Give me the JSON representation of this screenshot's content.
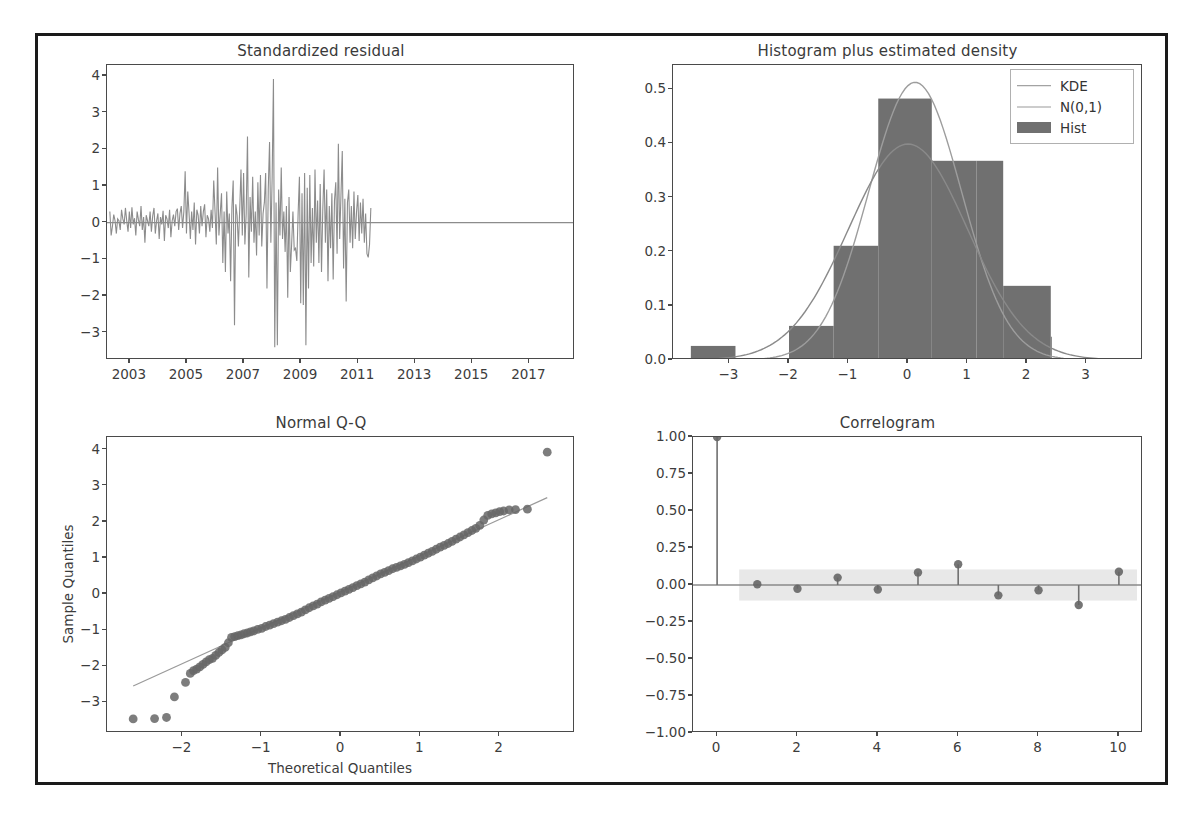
{
  "figure": {
    "background": "#ffffff",
    "frame_color": "#1a1a1a",
    "line_color": "#8c8c8c",
    "marker_color": "#666666",
    "hist_fill": "#707070",
    "ci_band": "#e8e8e8"
  },
  "panels": {
    "residual": {
      "title": "Standardized residual",
      "xticks": [
        "2003",
        "2005",
        "2007",
        "2009",
        "2011",
        "2013",
        "2015",
        "2017"
      ],
      "yticks": [
        "4",
        "3",
        "2",
        "1",
        "0",
        "−1",
        "−2",
        "−3"
      ]
    },
    "histogram": {
      "title": "Histogram plus estimated density",
      "xticks": [
        "−3",
        "−2",
        "−1",
        "0",
        "1",
        "2",
        "3"
      ],
      "yticks": [
        "0.5",
        "0.4",
        "0.3",
        "0.2",
        "0.1",
        "0.0"
      ],
      "legend": [
        {
          "label": "KDE",
          "type": "line"
        },
        {
          "label": "N(0,1)",
          "type": "line"
        },
        {
          "label": "Hist",
          "type": "patch"
        }
      ]
    },
    "qq": {
      "title": "Normal Q-Q",
      "xlabel": "Theoretical Quantiles",
      "ylabel": "Sample Quantiles",
      "xticks": [
        "−2",
        "−1",
        "0",
        "1",
        "2"
      ],
      "yticks": [
        "4",
        "3",
        "2",
        "1",
        "0",
        "−1",
        "−2",
        "−3"
      ]
    },
    "correlogram": {
      "title": "Correlogram",
      "xticks": [
        "0",
        "2",
        "4",
        "6",
        "8",
        "10"
      ],
      "yticks": [
        "1.00",
        "0.75",
        "0.50",
        "0.25",
        "0.00",
        "−0.25",
        "−0.50",
        "−0.75",
        "−1.00"
      ]
    }
  },
  "chart_data": [
    {
      "type": "line",
      "panel": "residual",
      "title": "Standardized residual",
      "xlabel": "",
      "ylabel": "",
      "xlim": [
        2002.2,
        2018.6
      ],
      "ylim": [
        -3.75,
        4.3
      ],
      "grid": false,
      "xtick_values": [
        2003,
        2005,
        2007,
        2009,
        2011,
        2013,
        2015,
        2017
      ],
      "ytick_values": [
        4,
        3,
        2,
        1,
        0,
        -1,
        -2,
        -3
      ],
      "series": [
        {
          "name": "standardized residual",
          "x_start": 2002.3,
          "x_step": 0.0455,
          "values": [
            0.3,
            -0.35,
            -0.1,
            0.22,
            0.05,
            -0.3,
            0.1,
            0.05,
            -0.2,
            0.35,
            0.1,
            -0.05,
            0.4,
            0.05,
            -0.25,
            0.3,
            -0.15,
            0.42,
            -0.05,
            0.12,
            -0.35,
            0.3,
            0.08,
            -0.1,
            0.45,
            -0.2,
            0.15,
            -0.55,
            0.2,
            0.05,
            -0.1,
            0.3,
            -0.25,
            0.18,
            0.4,
            -0.3,
            0.05,
            0.25,
            -0.45,
            0.15,
            -0.05,
            0.32,
            -0.5,
            0.2,
            0.1,
            -0.15,
            0.35,
            -0.4,
            0.05,
            0.22,
            -0.1,
            0.3,
            0.38,
            -0.2,
            0.25,
            0.45,
            -0.15,
            0.3,
            1.4,
            -0.3,
            0.85,
            0.25,
            -0.45,
            0.3,
            -0.2,
            0.55,
            -0.6,
            0.35,
            0.2,
            -0.3,
            0.45,
            -0.1,
            0.3,
            0.5,
            -0.4,
            0.2,
            0.1,
            -0.25,
            0.35,
            -0.15,
            1.15,
            0.3,
            -0.6,
            1.5,
            -0.35,
            0.25,
            0.8,
            -1.1,
            0.3,
            -1.35,
            0.85,
            -0.3,
            0.25,
            -1.6,
            0.4,
            1.15,
            -2.8,
            0.5,
            0.2,
            -0.65,
            0.35,
            1.45,
            -0.35,
            1.35,
            -0.6,
            0.25,
            2.35,
            -1.5,
            0.7,
            -0.25,
            1.25,
            -0.55,
            0.3,
            -0.9,
            1.1,
            -0.35,
            1.3,
            -0.65,
            0.25,
            0.55,
            1.35,
            -1.8,
            0.9,
            2.2,
            -0.55,
            1.25,
            3.92,
            -3.4,
            0.55,
            -3.35,
            0.9,
            -0.35,
            1.5,
            -0.45,
            0.3,
            -0.8,
            0.45,
            -2.05,
            0.7,
            -1.35,
            -0.6,
            0.3,
            -0.75,
            -0.7,
            -1.05,
            0.25,
            1.25,
            -2.2,
            0.8,
            -2.25,
            1.35,
            -3.35,
            0.95,
            -1.8,
            1.3,
            -1.1,
            0.4,
            -1.2,
            1.45,
            -0.55,
            0.6,
            -1.1,
            1.05,
            -1.35,
            0.35,
            1.45,
            -0.55,
            0.9,
            -1.6,
            0.45,
            -0.7,
            0.8,
            -1.55,
            0.6,
            1.1,
            -0.85,
            2.15,
            -0.45,
            0.75,
            1.95,
            -1.25,
            0.65,
            -2.15,
            0.55,
            0.9,
            -0.55,
            0.45,
            -0.7,
            0.85,
            -0.45,
            0.3,
            0.75,
            -0.5,
            0.55,
            -0.3,
            0.65,
            -0.55,
            0.25,
            -0.85,
            -0.95,
            -0.6,
            0.4
          ]
        },
        {
          "name": "zero-line",
          "constant": 0
        }
      ]
    },
    {
      "type": "bar",
      "panel": "histogram",
      "title": "Histogram plus estimated density",
      "xlabel": "",
      "ylabel": "",
      "xlim": [
        -3.95,
        3.95
      ],
      "ylim": [
        0.0,
        0.545
      ],
      "grid": false,
      "xtick_values": [
        -3,
        -2,
        -1,
        0,
        1,
        2,
        3
      ],
      "ytick_values": [
        0.0,
        0.1,
        0.2,
        0.3,
        0.4,
        0.5
      ],
      "bin_edges": [
        -3.65,
        -2.9,
        -2.0,
        -1.25,
        -0.5,
        0.4,
        1.15,
        1.6,
        2.4
      ],
      "bars": [
        {
          "left": -3.65,
          "right": -2.9,
          "height": 0.026
        },
        {
          "left": -2.9,
          "right": -2.0,
          "height": 0.003
        },
        {
          "left": -2.0,
          "right": -1.25,
          "height": 0.063
        },
        {
          "left": -1.25,
          "right": -0.5,
          "height": 0.211
        },
        {
          "left": -0.5,
          "right": 0.4,
          "height": 0.483
        },
        {
          "left": 0.4,
          "right": 1.15,
          "height": 0.368
        },
        {
          "left": 1.15,
          "right": 1.6,
          "height": 0.368
        },
        {
          "left": 1.6,
          "right": 2.4,
          "height": 0.137
        },
        {
          "left": 2.4,
          "right": 2.4,
          "height": 0.043
        }
      ],
      "curves": [
        {
          "name": "KDE",
          "peak_x": 0.12,
          "peak_y": 0.513,
          "sigma": 0.78
        },
        {
          "name": "N(0,1)",
          "peak_x": 0.0,
          "peak_y": 0.399,
          "sigma": 1.0
        }
      ]
    },
    {
      "type": "scatter",
      "panel": "qq",
      "title": "Normal Q-Q",
      "xlabel": "Theoretical Quantiles",
      "ylabel": "Sample Quantiles",
      "xlim": [
        -2.95,
        2.95
      ],
      "ylim": [
        -3.85,
        4.35
      ],
      "grid": false,
      "xtick_values": [
        -2,
        -1,
        0,
        1,
        2
      ],
      "ytick_values": [
        4,
        3,
        2,
        1,
        0,
        -1,
        -2,
        -3
      ],
      "reference_line": {
        "slope": 1.0,
        "intercept": 0.07,
        "x_from": -2.62,
        "x_to": 2.6
      },
      "points": [
        [
          -2.62,
          -3.46
        ],
        [
          -2.35,
          -3.45
        ],
        [
          -2.2,
          -3.42
        ],
        [
          -2.1,
          -2.85
        ],
        [
          -1.96,
          -2.45
        ],
        [
          -1.9,
          -2.2
        ],
        [
          -1.86,
          -2.12
        ],
        [
          -1.82,
          -2.08
        ],
        [
          -1.78,
          -2.02
        ],
        [
          -1.74,
          -1.95
        ],
        [
          -1.7,
          -1.88
        ],
        [
          -1.66,
          -1.82
        ],
        [
          -1.62,
          -1.78
        ],
        [
          -1.58,
          -1.7
        ],
        [
          -1.54,
          -1.62
        ],
        [
          -1.5,
          -1.55
        ],
        [
          -1.46,
          -1.48
        ],
        [
          -1.42,
          -1.35
        ],
        [
          -1.38,
          -1.2
        ],
        [
          -1.34,
          -1.18
        ],
        [
          -1.3,
          -1.15
        ],
        [
          -1.26,
          -1.13
        ],
        [
          -1.22,
          -1.1
        ],
        [
          -1.18,
          -1.08
        ],
        [
          -1.14,
          -1.05
        ],
        [
          -1.1,
          -1.02
        ],
        [
          -1.05,
          -0.98
        ],
        [
          -1.0,
          -0.95
        ],
        [
          -0.95,
          -0.9
        ],
        [
          -0.9,
          -0.86
        ],
        [
          -0.85,
          -0.82
        ],
        [
          -0.8,
          -0.78
        ],
        [
          -0.75,
          -0.74
        ],
        [
          -0.7,
          -0.7
        ],
        [
          -0.65,
          -0.65
        ],
        [
          -0.6,
          -0.6
        ],
        [
          -0.55,
          -0.55
        ],
        [
          -0.5,
          -0.5
        ],
        [
          -0.45,
          -0.44
        ],
        [
          -0.4,
          -0.38
        ],
        [
          -0.35,
          -0.33
        ],
        [
          -0.3,
          -0.28
        ],
        [
          -0.25,
          -0.22
        ],
        [
          -0.2,
          -0.17
        ],
        [
          -0.15,
          -0.12
        ],
        [
          -0.1,
          -0.07
        ],
        [
          -0.05,
          -0.02
        ],
        [
          0.0,
          0.03
        ],
        [
          0.05,
          0.08
        ],
        [
          0.1,
          0.13
        ],
        [
          0.15,
          0.18
        ],
        [
          0.2,
          0.23
        ],
        [
          0.25,
          0.28
        ],
        [
          0.3,
          0.33
        ],
        [
          0.35,
          0.39
        ],
        [
          0.4,
          0.45
        ],
        [
          0.45,
          0.5
        ],
        [
          0.5,
          0.56
        ],
        [
          0.55,
          0.6
        ],
        [
          0.6,
          0.65
        ],
        [
          0.65,
          0.7
        ],
        [
          0.7,
          0.74
        ],
        [
          0.75,
          0.78
        ],
        [
          0.8,
          0.82
        ],
        [
          0.85,
          0.87
        ],
        [
          0.9,
          0.92
        ],
        [
          0.95,
          0.97
        ],
        [
          1.0,
          1.02
        ],
        [
          1.05,
          1.08
        ],
        [
          1.1,
          1.13
        ],
        [
          1.15,
          1.18
        ],
        [
          1.2,
          1.24
        ],
        [
          1.25,
          1.3
        ],
        [
          1.3,
          1.35
        ],
        [
          1.35,
          1.4
        ],
        [
          1.4,
          1.46
        ],
        [
          1.45,
          1.52
        ],
        [
          1.5,
          1.58
        ],
        [
          1.55,
          1.64
        ],
        [
          1.6,
          1.7
        ],
        [
          1.65,
          1.76
        ],
        [
          1.7,
          1.82
        ],
        [
          1.75,
          1.9
        ],
        [
          1.8,
          2.05
        ],
        [
          1.85,
          2.18
        ],
        [
          1.9,
          2.22
        ],
        [
          1.95,
          2.25
        ],
        [
          2.0,
          2.28
        ],
        [
          2.05,
          2.3
        ],
        [
          2.12,
          2.33
        ],
        [
          2.2,
          2.34
        ],
        [
          2.35,
          2.35
        ],
        [
          2.6,
          3.93
        ]
      ]
    },
    {
      "type": "bar",
      "panel": "correlogram",
      "title": "Correlogram",
      "xlabel": "",
      "ylabel": "",
      "xlim": [
        -0.6,
        10.6
      ],
      "ylim": [
        -1.0,
        1.0
      ],
      "grid": false,
      "xtick_values": [
        0,
        2,
        4,
        6,
        8,
        10
      ],
      "ytick_values": [
        1.0,
        0.75,
        0.5,
        0.25,
        0.0,
        -0.25,
        -0.5,
        -0.75,
        -1.0
      ],
      "lags": [
        0,
        1,
        2,
        3,
        4,
        5,
        6,
        7,
        8,
        9,
        10
      ],
      "acf": [
        1.0,
        0.005,
        -0.025,
        0.05,
        -0.03,
        0.085,
        0.14,
        -0.07,
        -0.035,
        -0.135,
        0.09
      ],
      "confidence_band": {
        "from_lag": 1,
        "to_lag": 10,
        "upper": 0.105,
        "lower": -0.105
      }
    }
  ]
}
